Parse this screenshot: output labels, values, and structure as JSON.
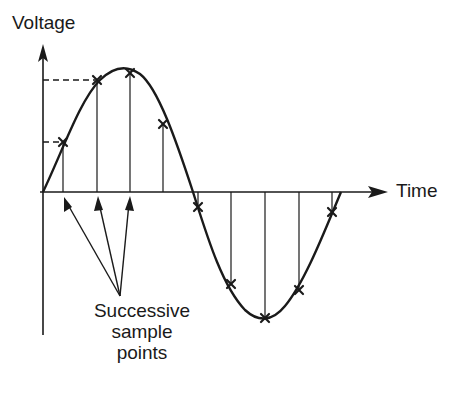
{
  "diagram": {
    "y_axis_label": "Voltage",
    "x_axis_label": "Time",
    "annotation": {
      "line1": "Successive",
      "line2": "sample",
      "line3": "points"
    },
    "colors": {
      "ink": "#1a1a1a",
      "background": "#ffffff"
    },
    "sample_points": [
      {
        "x": 63,
        "y": 142
      },
      {
        "x": 97,
        "y": 80
      },
      {
        "x": 130,
        "y": 73
      },
      {
        "x": 163,
        "y": 124
      },
      {
        "x": 198,
        "y": 207
      },
      {
        "x": 231,
        "y": 284
      },
      {
        "x": 265,
        "y": 318
      },
      {
        "x": 299,
        "y": 290
      },
      {
        "x": 332,
        "y": 212
      }
    ],
    "dashed_levels": [
      80,
      142
    ]
  }
}
